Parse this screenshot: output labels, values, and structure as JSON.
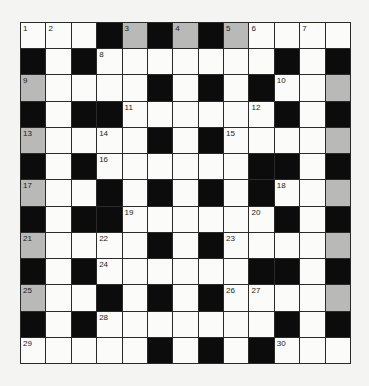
{
  "puzzle": {
    "type": "crossword",
    "rows": 13,
    "cols": 13,
    "legend": {
      "W": "white-cell",
      "B": "black-cell",
      "G": "shaded-cell"
    },
    "grid": [
      [
        "W",
        "W",
        "W",
        "B",
        "G",
        "B",
        "G",
        "B",
        "G",
        "W",
        "W",
        "W",
        "W"
      ],
      [
        "B",
        "W",
        "B",
        "W",
        "W",
        "W",
        "W",
        "W",
        "W",
        "W",
        "B",
        "W",
        "B"
      ],
      [
        "G",
        "W",
        "W",
        "W",
        "W",
        "B",
        "W",
        "B",
        "W",
        "B",
        "W",
        "W",
        "G"
      ],
      [
        "B",
        "W",
        "B",
        "B",
        "W",
        "W",
        "W",
        "W",
        "W",
        "W",
        "B",
        "W",
        "B"
      ],
      [
        "G",
        "W",
        "W",
        "W",
        "W",
        "B",
        "W",
        "B",
        "W",
        "W",
        "W",
        "W",
        "G"
      ],
      [
        "B",
        "W",
        "B",
        "W",
        "W",
        "W",
        "W",
        "W",
        "W",
        "B",
        "B",
        "W",
        "B"
      ],
      [
        "G",
        "W",
        "W",
        "B",
        "W",
        "B",
        "W",
        "B",
        "W",
        "B",
        "W",
        "W",
        "G"
      ],
      [
        "B",
        "W",
        "B",
        "B",
        "W",
        "W",
        "W",
        "W",
        "W",
        "W",
        "B",
        "W",
        "B"
      ],
      [
        "G",
        "W",
        "W",
        "W",
        "W",
        "B",
        "W",
        "B",
        "W",
        "W",
        "W",
        "W",
        "G"
      ],
      [
        "B",
        "W",
        "B",
        "W",
        "W",
        "W",
        "W",
        "W",
        "W",
        "B",
        "B",
        "W",
        "B"
      ],
      [
        "G",
        "W",
        "W",
        "B",
        "W",
        "B",
        "W",
        "B",
        "W",
        "W",
        "W",
        "W",
        "G"
      ],
      [
        "B",
        "W",
        "B",
        "W",
        "W",
        "W",
        "W",
        "W",
        "W",
        "W",
        "B",
        "W",
        "B"
      ],
      [
        "W",
        "W",
        "W",
        "W",
        "W",
        "B",
        "W",
        "B",
        "W",
        "B",
        "W",
        "W",
        "W"
      ]
    ],
    "numbers": [
      {
        "row": 0,
        "col": 0,
        "n": "1"
      },
      {
        "row": 0,
        "col": 1,
        "n": "2"
      },
      {
        "row": 0,
        "col": 4,
        "n": "3"
      },
      {
        "row": 0,
        "col": 6,
        "n": "4"
      },
      {
        "row": 0,
        "col": 8,
        "n": "5"
      },
      {
        "row": 0,
        "col": 9,
        "n": "6"
      },
      {
        "row": 0,
        "col": 11,
        "n": "7"
      },
      {
        "row": 1,
        "col": 3,
        "n": "8"
      },
      {
        "row": 2,
        "col": 0,
        "n": "9"
      },
      {
        "row": 2,
        "col": 10,
        "n": "10"
      },
      {
        "row": 3,
        "col": 4,
        "n": "11"
      },
      {
        "row": 3,
        "col": 9,
        "n": "12"
      },
      {
        "row": 4,
        "col": 0,
        "n": "13"
      },
      {
        "row": 4,
        "col": 3,
        "n": "14"
      },
      {
        "row": 4,
        "col": 8,
        "n": "15"
      },
      {
        "row": 5,
        "col": 3,
        "n": "16"
      },
      {
        "row": 6,
        "col": 0,
        "n": "17"
      },
      {
        "row": 6,
        "col": 10,
        "n": "18"
      },
      {
        "row": 7,
        "col": 4,
        "n": "19"
      },
      {
        "row": 7,
        "col": 9,
        "n": "20"
      },
      {
        "row": 8,
        "col": 0,
        "n": "21"
      },
      {
        "row": 8,
        "col": 3,
        "n": "22"
      },
      {
        "row": 8,
        "col": 8,
        "n": "23"
      },
      {
        "row": 9,
        "col": 3,
        "n": "24"
      },
      {
        "row": 10,
        "col": 0,
        "n": "25"
      },
      {
        "row": 10,
        "col": 8,
        "n": "26"
      },
      {
        "row": 10,
        "col": 9,
        "n": "27"
      },
      {
        "row": 11,
        "col": 3,
        "n": "28"
      },
      {
        "row": 12,
        "col": 0,
        "n": "29"
      },
      {
        "row": 12,
        "col": 10,
        "n": "30"
      }
    ],
    "colors": {
      "black": "#0c0c0c",
      "shaded": "#b9b9b8",
      "white": "#fbfbfa",
      "grid_line": "#2a2a2a",
      "page_background": "#f4f4f2"
    }
  }
}
